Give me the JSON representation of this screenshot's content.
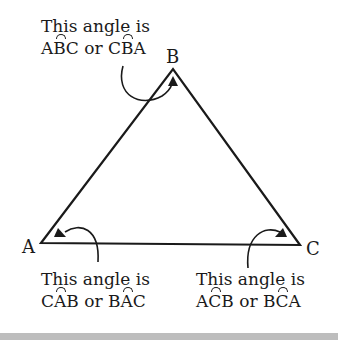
{
  "diagram": {
    "vertices": [
      {
        "name": "A",
        "x": 41,
        "y": 243
      },
      {
        "name": "B",
        "x": 173,
        "y": 69
      },
      {
        "name": "C",
        "x": 300,
        "y": 245
      }
    ],
    "annotations": {
      "B": {
        "line1": "This angle is",
        "line2_parts": [
          "A",
          "B",
          "C",
          " or ",
          "C",
          "B",
          "A"
        ]
      },
      "A": {
        "line1": "This angle is",
        "line2_parts": [
          "C",
          "A",
          "B",
          " or ",
          "B",
          "A",
          "C"
        ]
      },
      "C": {
        "line1": "This angle is",
        "line2_parts": [
          "A",
          "C",
          "B",
          " or ",
          "B",
          "C",
          "A"
        ]
      }
    },
    "colors": {
      "stroke": "#1a1a1a",
      "background": "#ffffff",
      "band": "#bdbdbd"
    }
  }
}
